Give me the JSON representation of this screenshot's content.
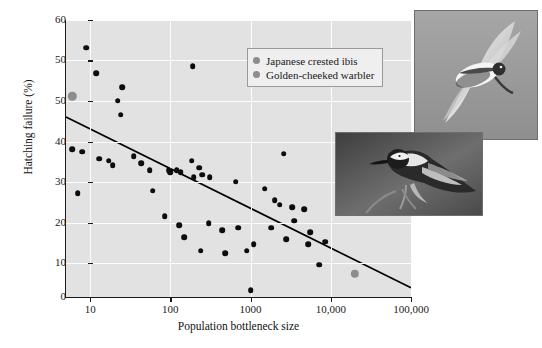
{
  "chart_data": {
    "type": "scatter",
    "title": "",
    "xlabel": "Population bottleneck size",
    "ylabel": "Hatching failure (%)",
    "xscale": "log",
    "xlim": [
      5,
      100000
    ],
    "ylim": [
      0,
      60
    ],
    "grid": true,
    "legend_position": "top-center-right",
    "xticks": [
      {
        "value": 10,
        "label": "10"
      },
      {
        "value": 100,
        "label": "100"
      },
      {
        "value": 1000,
        "label": "1000"
      },
      {
        "value": 10000,
        "label": "10,000"
      },
      {
        "value": 100000,
        "label": "100,000"
      }
    ],
    "yticks": [
      {
        "value": 60,
        "label": "60"
      },
      {
        "value": 50,
        "label": "50"
      },
      {
        "value": 40,
        "label": "50"
      },
      {
        "value": 30,
        "label": "40"
      },
      {
        "value": 20,
        "label": "30"
      },
      {
        "value": 10,
        "label": "20"
      },
      {
        "value": 5,
        "label": "10"
      },
      {
        "value": 0,
        "label": "0"
      }
    ],
    "ytick_positions_pct": [
      0,
      14.6,
      29.2,
      43.9,
      58.5,
      73.2,
      87.8,
      100
    ],
    "series": [
      {
        "name": "Other species",
        "color": "#0d0d0d",
        "points": [
          [
            9,
            54.0
          ],
          [
            12,
            48.5
          ],
          [
            25,
            45.5
          ],
          [
            190,
            50.0
          ],
          [
            22,
            42.5
          ],
          [
            24,
            39.5
          ],
          [
            6,
            32.0
          ],
          [
            8,
            31.5
          ],
          [
            13,
            30.0
          ],
          [
            17,
            29.5
          ],
          [
            19,
            28.5
          ],
          [
            35,
            30.5
          ],
          [
            43,
            29.0
          ],
          [
            55,
            27.5
          ],
          [
            95,
            27.5
          ],
          [
            100,
            27.0
          ],
          [
            120,
            27.5
          ],
          [
            135,
            27.0
          ],
          [
            185,
            29.5
          ],
          [
            195,
            26.0
          ],
          [
            230,
            28.0
          ],
          [
            250,
            26.5
          ],
          [
            310,
            26.0
          ],
          [
            650,
            25.0
          ],
          [
            1500,
            23.5
          ],
          [
            2600,
            31.0
          ],
          [
            2000,
            21.0
          ],
          [
            2300,
            20.0
          ],
          [
            3300,
            19.5
          ],
          [
            4700,
            19.0
          ],
          [
            7,
            22.5
          ],
          [
            60,
            23.0
          ],
          [
            85,
            17.5
          ],
          [
            300,
            16.0
          ],
          [
            130,
            15.5
          ],
          [
            150,
            13.0
          ],
          [
            440,
            14.5
          ],
          [
            700,
            15.0
          ],
          [
            1800,
            15.0
          ],
          [
            3500,
            16.5
          ],
          [
            5500,
            14.0
          ],
          [
            240,
            10.0
          ],
          [
            480,
            9.5
          ],
          [
            900,
            10.0
          ],
          [
            1100,
            11.5
          ],
          [
            2800,
            12.5
          ],
          [
            5200,
            11.5
          ],
          [
            8500,
            12.0
          ],
          [
            1000,
            1.5
          ],
          [
            7200,
            7.0
          ]
        ]
      },
      {
        "name": "Japanese crested ibis",
        "color": "#8d8d8d",
        "points": [
          [
            6,
            43.5
          ]
        ]
      },
      {
        "name": "Golden-cheeked warbler",
        "color": "#8d8d8d",
        "points": [
          [
            20000,
            5.0
          ]
        ]
      }
    ],
    "trendline": {
      "description": "linear regression of hatching failure on log10 bottleneck size",
      "x_start": 5,
      "y_start": 39.0,
      "x_end": 100000,
      "y_end": 2.0
    }
  },
  "legend": {
    "items": [
      {
        "label": "Japanese crested ibis",
        "color": "#8d8d8d"
      },
      {
        "label": "Golden-cheeked warbler",
        "color": "#8d8d8d"
      }
    ]
  },
  "photos": [
    {
      "name": "japanese-crested-ibis-photo",
      "caption": "Japanese crested ibis in flight"
    },
    {
      "name": "golden-cheeked-warbler-photo",
      "caption": "Golden-cheeked warbler perched on branch"
    }
  ]
}
